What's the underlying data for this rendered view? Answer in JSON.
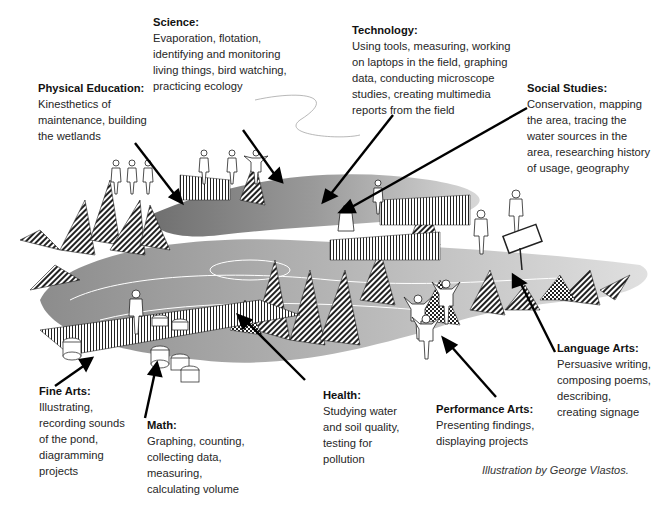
{
  "illustration": {
    "description": "Wetland field-study scene with students engaged in cross-curricular activities",
    "credit": "Illustration by George Vlastos."
  },
  "labels": [
    {
      "id": "science",
      "title": "Science:",
      "body": "Evaporation, flotation,\nidentifying and monitoring\nliving things, bird watching,\npracticing ecology"
    },
    {
      "id": "technology",
      "title": "Technology:",
      "body": "Using tools, measuring, working\non laptops in the field, graphing\ndata, conducting microscope\nstudies, creating multimedia\nreports from the field"
    },
    {
      "id": "physical-education",
      "title": "Physical Education:",
      "body": "Kinesthetics of\nmaintenance, building\nthe wetlands"
    },
    {
      "id": "social-studies",
      "title": "Social Studies:",
      "body": "Conservation, mapping\nthe area, tracing the\nwater sources in the\narea, researching history\nof usage, geography"
    },
    {
      "id": "language-arts",
      "title": "Language Arts:",
      "body": "Persuasive writing,\ncomposing poems,\ndescribing,\ncreating signage"
    },
    {
      "id": "fine-arts",
      "title": "Fine Arts:",
      "body": "Illustrating,\nrecording sounds\nof the pond,\ndiagramming\nprojects"
    },
    {
      "id": "math",
      "title": "Math:",
      "body": "Graphing, counting,\ncollecting data,\nmeasuring,\ncalculating volume"
    },
    {
      "id": "health",
      "title": "Health:",
      "body": "Studying water\nand soil quality,\ntesting for\npollution"
    },
    {
      "id": "performance-arts",
      "title": "Performance Arts:",
      "body": "Presenting findings,\ndisplaying projects"
    }
  ],
  "colors": {
    "water_dark": "#8a8a8a",
    "water_light": "#cfcfcf",
    "ink": "#111111",
    "background": "#ffffff"
  }
}
